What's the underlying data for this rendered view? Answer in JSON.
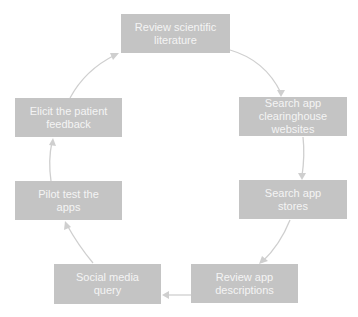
{
  "diagram": {
    "type": "cycle",
    "colors": {
      "box_fill": "#c4c4c4",
      "box_text": "#f4f4f4",
      "arrow": "#cfcfcf"
    },
    "steps": [
      {
        "id": "review-literature",
        "label": "Review scientific literature"
      },
      {
        "id": "search-clearinghouse",
        "label": "Search app clearinghouse websites"
      },
      {
        "id": "search-app-stores",
        "label": "Search app stores"
      },
      {
        "id": "review-descriptions",
        "label": "Review app descriptions"
      },
      {
        "id": "social-media-query",
        "label": "Social media query"
      },
      {
        "id": "pilot-test",
        "label": "Pilot test the apps"
      },
      {
        "id": "elicit-feedback",
        "label": "Elicit the patient feedback"
      }
    ],
    "edges": [
      {
        "from": "review-literature",
        "to": "search-clearinghouse"
      },
      {
        "from": "search-clearinghouse",
        "to": "search-app-stores"
      },
      {
        "from": "search-app-stores",
        "to": "review-descriptions"
      },
      {
        "from": "review-descriptions",
        "to": "social-media-query"
      },
      {
        "from": "social-media-query",
        "to": "pilot-test"
      },
      {
        "from": "pilot-test",
        "to": "elicit-feedback"
      },
      {
        "from": "elicit-feedback",
        "to": "review-literature"
      }
    ]
  }
}
